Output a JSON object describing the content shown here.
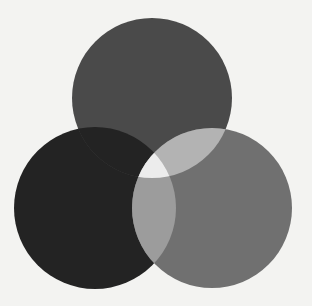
{
  "diagram": {
    "type": "three-circle-venn",
    "background": "#f3f3f1",
    "circles": [
      {
        "name": "top",
        "cx": 152,
        "cy": 98,
        "r": 80,
        "color": "#4a4a4a"
      },
      {
        "name": "left",
        "cx": 95,
        "cy": 208,
        "r": 81,
        "color": "#232323"
      },
      {
        "name": "right",
        "cx": 212,
        "cy": 208,
        "r": 80,
        "color": "#707070"
      }
    ],
    "overlaps": {
      "top_right": "#b3b3b3",
      "left_right": "#9c9c9c",
      "top_left": "#232323",
      "center": "#ececec"
    }
  }
}
